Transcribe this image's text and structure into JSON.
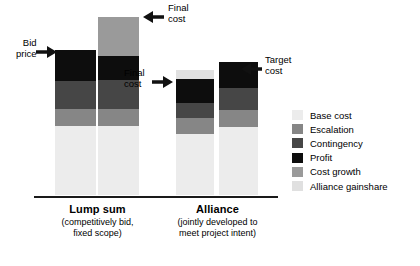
{
  "chart_data": {
    "type": "bar",
    "title": "",
    "subtitle": "",
    "xlabel": "",
    "ylabel": "",
    "grid": false,
    "stacked": true,
    "legend_position": "right",
    "categories": [
      "Bid price",
      "Final cost",
      "Final cost",
      "Target cost"
    ],
    "groups": [
      {
        "name": "Lump sum",
        "caption_lines": [
          "(competitively bid,",
          "fixed scope)"
        ],
        "bars": [
          "bid-price",
          "final-cost"
        ]
      },
      {
        "name": "Alliance",
        "caption_lines": [
          "(jointly developed to",
          "meet project intent)"
        ],
        "bars": [
          "final-cost",
          "target-cost"
        ]
      }
    ],
    "series": [
      {
        "name": "Base cost",
        "color": "#ececec",
        "values": [
          62,
          62,
          62,
          62
        ]
      },
      {
        "name": "Escalation",
        "color": "#868686",
        "values": [
          17,
          17,
          17,
          17
        ]
      },
      {
        "name": "Contingency",
        "color": "#464646",
        "values": [
          28,
          28,
          22,
          28
        ]
      },
      {
        "name": "Profit",
        "color": "#0d0d0d",
        "values": [
          31,
          22,
          27,
          28
        ]
      },
      {
        "name": "Cost growth",
        "color": "#9a9a9a",
        "values": [
          0,
          39,
          0,
          0
        ]
      },
      {
        "name": "Alliance gainshare",
        "color": "#e0e0e0",
        "values": [
          0,
          0,
          9,
          0
        ]
      }
    ],
    "annotations": [
      {
        "label_lines": [
          "Bid",
          "price"
        ],
        "arrow": "right",
        "target": "bar-1-top"
      },
      {
        "label_lines": [
          "Final",
          "cost"
        ],
        "arrow": "left",
        "target": "bar-2-top"
      },
      {
        "label_lines": [
          "Final",
          "cost"
        ],
        "arrow": "right",
        "target": "bar-3-top"
      },
      {
        "label_lines": [
          "Target",
          "cost"
        ],
        "arrow": "left",
        "target": "bar-4-top"
      }
    ]
  },
  "legend": {
    "items": [
      {
        "label": "Base cost",
        "color": "#ececec"
      },
      {
        "label": "Escalation",
        "color": "#868686"
      },
      {
        "label": "Contingency",
        "color": "#464646"
      },
      {
        "label": "Profit",
        "color": "#0d0d0d"
      },
      {
        "label": "Cost growth",
        "color": "#9a9a9a"
      },
      {
        "label": "Alliance gainshare",
        "color": "#e0e0e0"
      }
    ]
  },
  "groups": {
    "lump_sum": {
      "title": "Lump sum",
      "sub_line1": "(competitively bid,",
      "sub_line2": "fixed scope)"
    },
    "alliance": {
      "title": "Alliance",
      "sub_line1": "(jointly developed to",
      "sub_line2": "meet project intent)"
    }
  },
  "annotations": {
    "bid_price": {
      "line1": "Bid",
      "line2": "price"
    },
    "lump_final_cost": {
      "line1": "Final",
      "line2": "cost"
    },
    "alliance_final_cost": {
      "line1": "Final",
      "line2": "cost"
    },
    "alliance_target_cost": {
      "line1": "Target",
      "line2": "cost"
    }
  },
  "colors": {
    "base_cost": "#ececec",
    "escalation": "#868686",
    "contingency": "#464646",
    "profit": "#0d0d0d",
    "cost_growth": "#9a9a9a",
    "alliance_gainshare": "#e0e0e0",
    "axis": "#1a1a1a",
    "text": "#000000"
  }
}
